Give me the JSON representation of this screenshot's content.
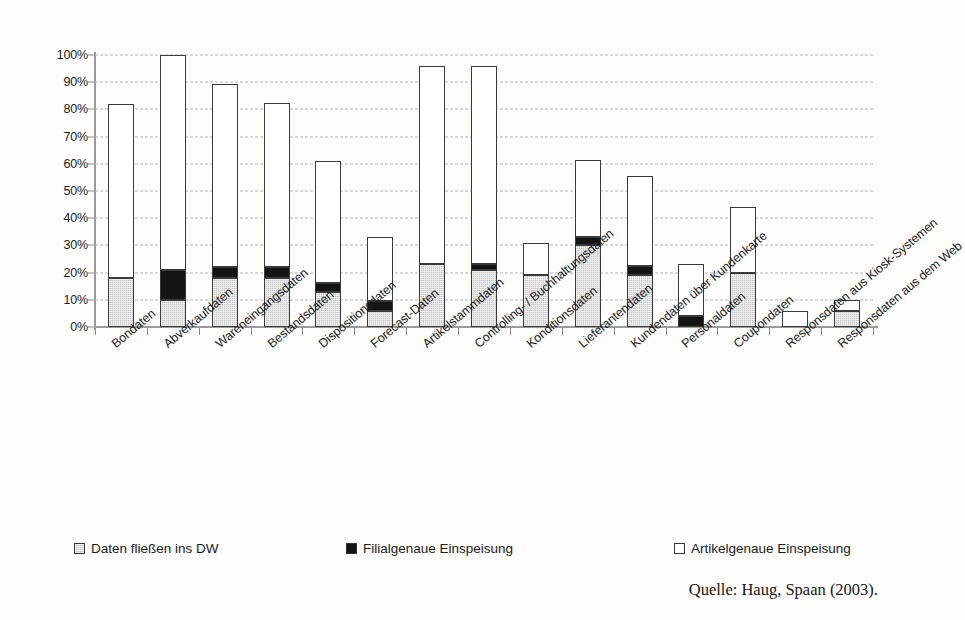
{
  "chart_data": {
    "type": "bar",
    "subtype": "stacked-bar",
    "title": "",
    "xlabel": "",
    "ylabel": "",
    "ylim": [
      0,
      100
    ],
    "y_unit": "%",
    "grid": true,
    "grid_axis": "y",
    "legend_position": "bottom",
    "stacked_total_is_top": true,
    "yticks": [
      "0%",
      "10%",
      "20%",
      "30%",
      "40%",
      "50%",
      "60%",
      "70%",
      "80%",
      "90%",
      "100%"
    ],
    "ytick_values": [
      0,
      10,
      20,
      30,
      40,
      50,
      60,
      70,
      80,
      90,
      100
    ],
    "categories": [
      "Bondaten",
      "Abverkaufdaten",
      "Wareneingangsdaten",
      "Bestandsdaten",
      "Dispositionsdaten",
      "Forecast-Daten",
      "Artikelstammdaten",
      "Controlling- / Buchhaltungsdaten",
      "Konditionsdaten",
      "Lieferantendaten",
      "Kundendaten über Kundenkarte",
      "Personaldaten",
      "Coupondaten",
      "Responsdaten aus Kiosk-Systemen",
      "Responsdaten aus dem Web"
    ],
    "series": [
      {
        "name": "Daten fließen ins DW",
        "color": "#c6c6c6",
        "fill": "gray-hatched",
        "values": [
          18,
          10,
          18,
          18,
          13,
          6,
          23,
          21,
          19,
          30,
          19,
          0,
          20,
          0,
          6
        ]
      },
      {
        "name": "Filialgenaue Einspeisung",
        "color": "#141414",
        "fill": "black",
        "values": [
          0,
          11,
          4,
          4,
          3,
          3.5,
          0,
          2,
          0,
          3,
          3.5,
          4,
          0,
          0,
          0
        ]
      },
      {
        "name": "Artikelgenaue Einspeisung",
        "color": "#ffffff",
        "fill": "white",
        "values": [
          64,
          79,
          67.5,
          60.5,
          45,
          23.5,
          73,
          73,
          12,
          28.5,
          33,
          19,
          24,
          6,
          4
        ]
      }
    ],
    "totals": [
      82,
      100,
      89.5,
      82.5,
      61,
      33,
      96,
      96,
      31,
      61.5,
      55.5,
      23,
      44,
      6,
      10
    ]
  },
  "legend": {
    "items": [
      {
        "label": "Daten fließen ins DW",
        "swatch": "gray"
      },
      {
        "label": "Filialgenaue Einspeisung",
        "swatch": "black"
      },
      {
        "label": "Artikelgenaue Einspeisung",
        "swatch": "white"
      }
    ]
  },
  "source": {
    "text": "Quelle: Haug, Spaan (2003)."
  }
}
